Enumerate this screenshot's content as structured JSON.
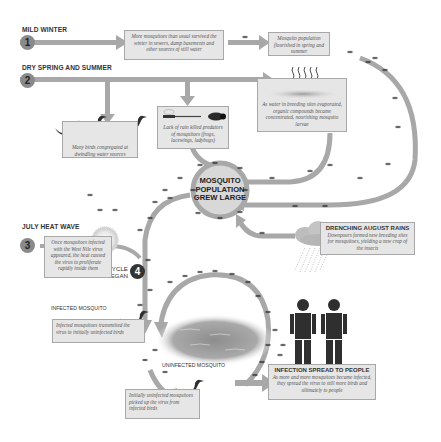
{
  "diagram": {
    "colors": {
      "arrow": "#a8a8a8",
      "box_fill": "#e6e6e6",
      "box_border": "#a8a8a8",
      "center_circle": "#d6d6d6",
      "dark": "#2f2f2f",
      "number_badge": "#8a8a8a"
    },
    "steps": [
      {
        "number": "1",
        "heading": "MILD WINTER"
      },
      {
        "number": "2",
        "heading": "DRY SPRING AND SUMMER"
      },
      {
        "number": "3",
        "heading": "JULY HEAT WAVE"
      },
      {
        "number": "4",
        "heading": "VICIOUS CYCLE BEGAN"
      }
    ],
    "boxes": {
      "survived_winter": "More mosquitoes than usual survived the winter in sewers, damp basements and other sources of still water",
      "flourished": "Mosquito population flourished in spring and summer",
      "organic_compounds": "As water in breeding sites evaporated, organic compounds became concentrated, nourishing mosquito larvae",
      "predators_killed": "Lack of rain killed predators of mosquitoes (frogs, lacewings, ladybugs)",
      "birds_congregated": "Many birds congregated at dwindling water sources",
      "heat_wave": "Once mosquitoes infected with the West Nile virus appeared, the heat caused the virus to proliferate rapidly inside them",
      "august_rains_title": "DRENCHING AUGUST RAINS",
      "august_rains": "Downpours formed new breeding sites for mosquitoes, yielding a new crop of the insects",
      "infected_transmit": "Infected mosquitoes transmitted the virus to initially uninfected birds",
      "uninfected_pickup": "Initially uninfected mosquitoes picked up the virus from infected birds",
      "people_title": "INFECTION SPREAD TO PEOPLE",
      "people": "As more and more mosquitoes became infected, they spread the virus to still more birds and ultimately to people"
    },
    "center": {
      "label_line1": "MOSQUITO",
      "label_line2": "POPULATION",
      "label_line3": "GREW LARGE"
    },
    "vicious_cycle": {
      "line1": "VICIOUS CYCLE",
      "line2": "BEGAN"
    },
    "labels": {
      "infected_mosquito": "INFECTED MOSQUITO",
      "uninfected_mosquito": "UNINFECTED MOSQUITO"
    },
    "icons": [
      "sun-icon",
      "rain-cloud-icon",
      "bird-icon",
      "person-icon",
      "mosquito-icon",
      "dragonfly-icon",
      "ladybug-icon",
      "pond-icon",
      "vapor-icon"
    ]
  }
}
